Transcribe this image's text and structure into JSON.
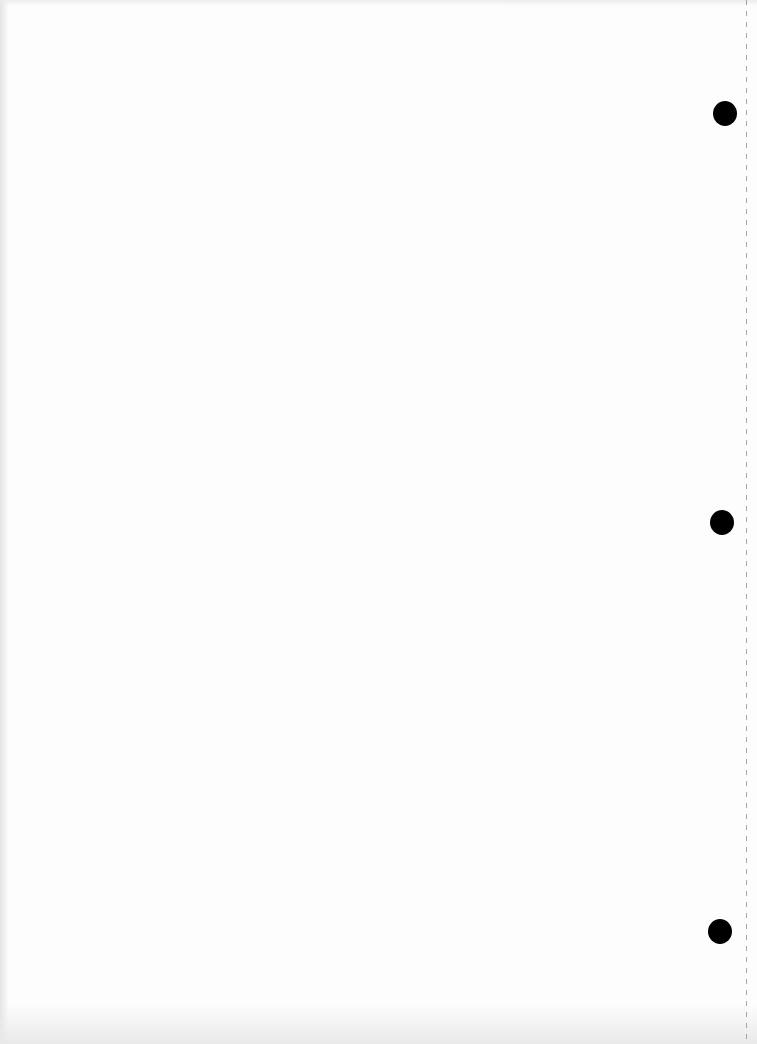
{
  "document": {
    "type": "blank scanned page",
    "text": "",
    "punch_holes": [
      {
        "x": 713,
        "y": 101
      },
      {
        "x": 710,
        "y": 510
      },
      {
        "x": 708,
        "y": 919
      }
    ],
    "colors": {
      "paper": "#fdfdfd",
      "hole": "#000000",
      "perforation": "#8a8a8a"
    }
  }
}
